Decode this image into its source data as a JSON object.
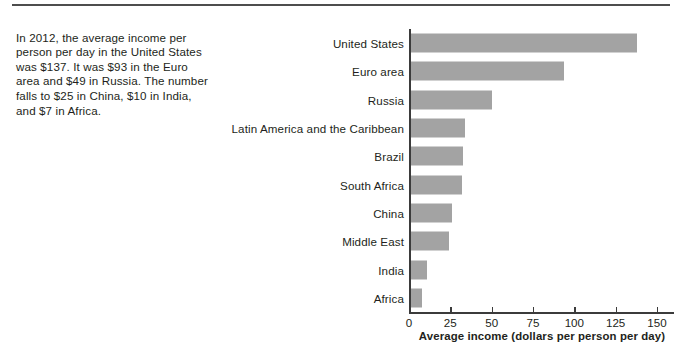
{
  "page": {
    "divider_name": "top-rule"
  },
  "caption": {
    "text": "In 2012, the average income per person per day in the United States was $137. It was $93 in the Euro area and $49 in Russia. The number falls to $25 in China, $10 in India, and $7 in Africa."
  },
  "chart_data": {
    "type": "bar",
    "orientation": "horizontal",
    "title": "",
    "xlabel": "Average income (dollars per person per day)",
    "ylabel": "",
    "xlim": [
      0,
      160
    ],
    "xticks": [
      0,
      25,
      50,
      75,
      100,
      125,
      150
    ],
    "xtick_labels": [
      "0",
      "25",
      "50",
      "75",
      "100",
      "125",
      "150"
    ],
    "grid": false,
    "legend": false,
    "bar_color": "#a3a3a3",
    "axis_color": "#3b3b3b",
    "text_color": "#231f20",
    "categories": [
      "United States",
      "Euro area",
      "Russia",
      "Latin America and the Caribbean",
      "Brazil",
      "South Africa",
      "China",
      "Middle East",
      "India",
      "Africa"
    ],
    "values": [
      137,
      93,
      49,
      33,
      32,
      31,
      25,
      23,
      10,
      7
    ]
  }
}
